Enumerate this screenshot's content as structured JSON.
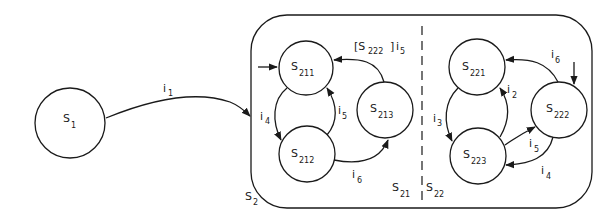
{
  "diagram": {
    "type": "statechart",
    "states": {
      "s1": {
        "base": "S",
        "sub": "1"
      },
      "s2": {
        "base": "S",
        "sub": "2"
      },
      "s21": {
        "base": "S",
        "sub": "21"
      },
      "s22": {
        "base": "S",
        "sub": "22"
      },
      "s211": {
        "base": "S",
        "sub": "211"
      },
      "s212": {
        "base": "S",
        "sub": "212"
      },
      "s213": {
        "base": "S",
        "sub": "213"
      },
      "s221": {
        "base": "S",
        "sub": "221"
      },
      "s222": {
        "base": "S",
        "sub": "222"
      },
      "s223": {
        "base": "S",
        "sub": "223"
      }
    },
    "transitions": {
      "t_s1_s2": {
        "base": "i",
        "sub": "1"
      },
      "t_s211_s212": {
        "base": "i",
        "sub": "4"
      },
      "t_s212_s211": {
        "base": "i",
        "sub": "5"
      },
      "t_s212_s213": {
        "base": "i",
        "sub": "6"
      },
      "t_s213_s211": {
        "guard_open": "[S",
        "guard_sub": "222",
        "guard_close": "]",
        "base": "i",
        "sub": "5"
      },
      "t_s221_s223": {
        "base": "i",
        "sub": "3"
      },
      "t_s223_s221": {
        "base": "i",
        "sub": "2"
      },
      "t_s222_s221": {
        "base": "i",
        "sub": "6"
      },
      "t_s223_s222": {
        "base": "i",
        "sub": "5"
      },
      "t_s222_s223": {
        "base": "i",
        "sub": "4"
      }
    },
    "colors": {
      "stroke": "#1a1a1a",
      "background": "#ffffff"
    }
  }
}
